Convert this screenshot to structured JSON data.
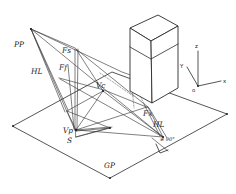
{
  "figure": {
    "background_color": "#ffffff",
    "ink_color": "#2a2a2a",
    "width": 236,
    "height": 194
  },
  "labels": {
    "picture_plane": "PP",
    "horizon_left": "HL",
    "horizon_right": "HL",
    "vanishing_side": "Fs",
    "vanishing_front": "Ff",
    "vanishing_center": "Vc",
    "vanishing_point": "Vp",
    "station_point": "S",
    "vanishing_x": "Fx",
    "ground_plane": "GP",
    "angle_note": "≠ 90°"
  },
  "axes": {
    "z": "z",
    "y": "Y",
    "x": "x",
    "origin": "o"
  },
  "geometry": {
    "ground_plane_corners": "quadrilateral",
    "object": "rectangular-prism",
    "right_angle_marker": "square"
  }
}
